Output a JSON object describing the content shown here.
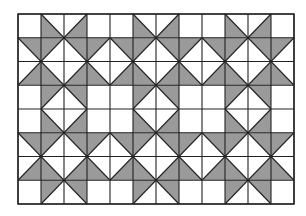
{
  "colors": {
    "background": "#ffffff",
    "shade": "#9a9a9a",
    "line": "#222222",
    "empty": "#ffffff"
  },
  "grid": {
    "x": 18,
    "y": 14,
    "cols": 12,
    "rows": 8,
    "cell_width": 23,
    "cell_height": 23.75,
    "legend": {
      "W": "empty square",
      "LL": "diagonal top-left to bottom-right, lower-left triangle shaded",
      "LR": "diagonal top-right to bottom-left, lower-right triangle shaded",
      "UR": "diagonal top-left to bottom-right, upper-right triangle shaded",
      "UL": "diagonal top-right to bottom-left, upper-left triangle shaded"
    },
    "cells": [
      [
        "W",
        "LL",
        "LR",
        "W",
        "W",
        "LL",
        "LR",
        "W",
        "W",
        "LL",
        "LR",
        "W"
      ],
      [
        "UR",
        "UL",
        "UR",
        "UL",
        "UR",
        "UL",
        "UR",
        "UL",
        "UR",
        "UL",
        "UR",
        "UL"
      ],
      [
        "LR",
        "LL",
        "LR",
        "LL",
        "LR",
        "LL",
        "LR",
        "LL",
        "LR",
        "LL",
        "LR",
        "LL"
      ],
      [
        "W",
        "UL",
        "UR",
        "W",
        "W",
        "UL",
        "UR",
        "W",
        "W",
        "UL",
        "UR",
        "W"
      ],
      [
        "W",
        "LL",
        "LR",
        "W",
        "W",
        "LL",
        "LR",
        "W",
        "W",
        "LL",
        "LR",
        "W"
      ],
      [
        "UR",
        "UL",
        "UR",
        "UL",
        "UR",
        "UL",
        "UR",
        "UL",
        "UR",
        "UL",
        "UR",
        "UL"
      ],
      [
        "LR",
        "LL",
        "LR",
        "LL",
        "LR",
        "LL",
        "LR",
        "LL",
        "LR",
        "LL",
        "LR",
        "LL"
      ],
      [
        "W",
        "UL",
        "UR",
        "W",
        "W",
        "UL",
        "UR",
        "W",
        "W",
        "UL",
        "UR",
        "W"
      ]
    ]
  }
}
